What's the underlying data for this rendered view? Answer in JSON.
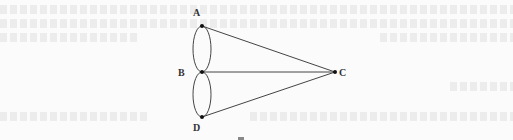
{
  "diagram": {
    "type": "graph",
    "nodes": [
      {
        "id": "A",
        "label": "A",
        "x": 202,
        "y": 26,
        "lx": 193,
        "ly": 16
      },
      {
        "id": "B",
        "label": "B",
        "x": 202,
        "y": 72,
        "lx": 178,
        "ly": 76
      },
      {
        "id": "C",
        "label": "C",
        "x": 335,
        "y": 72,
        "lx": 339,
        "ly": 76
      },
      {
        "id": "D",
        "label": "D",
        "x": 202,
        "y": 117,
        "lx": 193,
        "ly": 131
      }
    ],
    "edges": [
      {
        "from": "A",
        "to": "B",
        "style": "arc-left"
      },
      {
        "from": "A",
        "to": "B",
        "style": "arc-right"
      },
      {
        "from": "B",
        "to": "D",
        "style": "arc-left"
      },
      {
        "from": "B",
        "to": "D",
        "style": "arc-right"
      },
      {
        "from": "A",
        "to": "C",
        "style": "straight"
      },
      {
        "from": "B",
        "to": "C",
        "style": "straight"
      },
      {
        "from": "D",
        "to": "C",
        "style": "straight"
      }
    ]
  }
}
